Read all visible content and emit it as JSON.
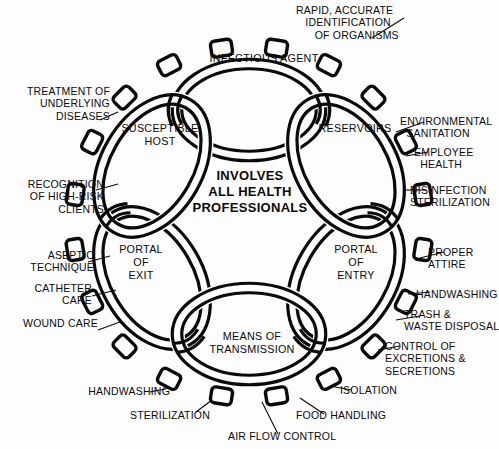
{
  "diagram": {
    "center_text": "INVOLVES\nALL HEALTH\nPROFESSIONALS",
    "ink_color": "#0a0a0a",
    "background_color": "#fdfdfd"
  },
  "links": [
    {
      "id": "infectious-agent",
      "label": "INFECTIOUS AGENT"
    },
    {
      "id": "reservoirs",
      "label": "RESERVOIRS"
    },
    {
      "id": "portal-of-entry",
      "label": "PORTAL\nOF\nENTRY"
    },
    {
      "id": "means-of-transmission",
      "label": "MEANS OF\nTRANSMISSION"
    },
    {
      "id": "portal-of-exit",
      "label": "PORTAL\nOF\nEXIT"
    },
    {
      "id": "susceptible-host",
      "label": "SUSCEPTIBLE\nHOST"
    }
  ],
  "interventions": [
    {
      "id": "rapid-identification",
      "label": "RAPID, ACCURATE\n   IDENTIFICATION\n      OF ORGANISMS"
    },
    {
      "id": "environmental-sanitation",
      "label": "ENVIRONMENTAL\n  SANITATION"
    },
    {
      "id": "employee-health",
      "label": "EMPLOYEE\n  HEALTH"
    },
    {
      "id": "disinfection-sterilization",
      "label": "DISINFECTION\nSTERILIZATION"
    },
    {
      "id": "proper-attire",
      "label": "PROPER\nATTIRE"
    },
    {
      "id": "handwashing-right",
      "label": "HANDWASHING"
    },
    {
      "id": "trash-waste-disposal",
      "label": "TRASH &\nWASTE DISPOSAL"
    },
    {
      "id": "control-of-excretions",
      "label": "CONTROL OF\nEXCRETIONS &\nSECRETIONS"
    },
    {
      "id": "isolation",
      "label": "ISOLATION"
    },
    {
      "id": "food-handling",
      "label": "FOOD HANDLING"
    },
    {
      "id": "air-flow-control",
      "label": "AIR FLOW CONTROL"
    },
    {
      "id": "sterilization",
      "label": "STERILIZATION"
    },
    {
      "id": "handwashing-left",
      "label": "HANDWASHING"
    },
    {
      "id": "wound-care",
      "label": "WOUND CARE"
    },
    {
      "id": "catheter-care",
      "label": "CATHETER\nCARE"
    },
    {
      "id": "aseptic-technique",
      "label": "ASEPTIC\nTECHNIQUE"
    },
    {
      "id": "recognition-high-risk",
      "label": "RECOGNITION\nOF HIGH-RISK\nCLIENTS"
    },
    {
      "id": "treatment-underlying",
      "label": "TREATMENT OF\nUNDERLYING\nDISEASES"
    }
  ]
}
